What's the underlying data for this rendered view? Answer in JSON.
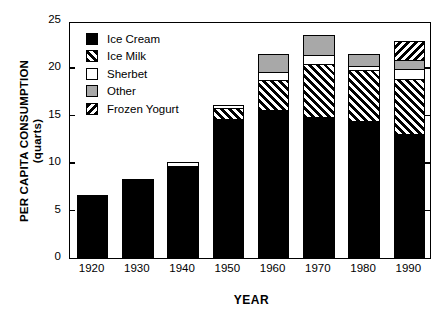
{
  "chart_data": {
    "type": "bar",
    "stacked": true,
    "title": "",
    "xlabel": "YEAR",
    "ylabel": "PER CAPITA CONSUMPTION\n(quarts)",
    "ylabel_line1": "PER CAPITA CONSUMPTION",
    "ylabel_line2": "(quarts)",
    "ylim": [
      0,
      25
    ],
    "yticks": [
      0,
      5,
      10,
      15,
      20,
      25
    ],
    "ytick_labels": [
      "0",
      "5",
      "10",
      "15",
      "20",
      "25"
    ],
    "grid": false,
    "legend_position": "upper-left-inside",
    "categories": [
      "1920",
      "1930",
      "1940",
      "1950",
      "1960",
      "1970",
      "1980",
      "1990"
    ],
    "series": [
      {
        "name": "Ice Cream",
        "key": "icecream",
        "pattern": "solid-black",
        "color": "#000000",
        "values": [
          6.6,
          8.3,
          9.7,
          14.7,
          15.6,
          14.9,
          14.5,
          13.1
        ]
      },
      {
        "name": "Ice Milk",
        "key": "icemilk",
        "pattern": "diagonal-hatch-right",
        "color": "#ffffff",
        "values": [
          0,
          0,
          0,
          1.1,
          3.2,
          5.6,
          5.3,
          5.8
        ]
      },
      {
        "name": "Sherbet",
        "key": "sherbet",
        "pattern": "white",
        "color": "#ffffff",
        "values": [
          0,
          0,
          0.4,
          0.3,
          0.8,
          0.9,
          0.5,
          1.0
        ]
      },
      {
        "name": "Other",
        "key": "other",
        "pattern": "solid-gray",
        "color": "#a8a8a8",
        "values": [
          0,
          0,
          0,
          0,
          1.9,
          2.1,
          1.2,
          1.0
        ]
      },
      {
        "name": "Frozen Yogurt",
        "key": "yogurt",
        "pattern": "diagonal-hatch-left",
        "color": "#ffffff",
        "values": [
          0,
          0,
          0,
          0,
          0,
          0,
          0,
          2.0
        ]
      }
    ],
    "totals": [
      6.6,
      8.3,
      10.1,
      16.1,
      21.5,
      23.4,
      21.5,
      22.9
    ]
  },
  "legend": {
    "items": [
      {
        "label": "Ice Cream",
        "swatch": "icecream"
      },
      {
        "label": "Ice Milk",
        "swatch": "icemilk"
      },
      {
        "label": "Sherbet",
        "swatch": "sherbet"
      },
      {
        "label": "Other",
        "swatch": "other"
      },
      {
        "label": "Frozen Yogurt",
        "swatch": "yogurt"
      }
    ]
  }
}
